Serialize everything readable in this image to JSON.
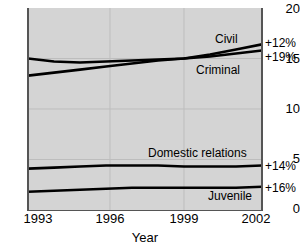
{
  "chart_data": {
    "type": "line",
    "title": "",
    "xlabel": "Year",
    "ylabel": "",
    "xlim": [
      1993,
      2002
    ],
    "ylim": [
      0,
      20
    ],
    "grid": true,
    "legend_position": "inline-right",
    "xticks": [
      "1993",
      "1996",
      "1999",
      "2002"
    ],
    "xtick_values": [
      1993,
      1996,
      1999,
      2002
    ],
    "yticks": [
      "0",
      "5",
      "10",
      "15",
      "20"
    ],
    "ytick_values": [
      0,
      5,
      10,
      15,
      20
    ],
    "x": [
      1993,
      1994,
      1995,
      1996,
      1997,
      1998,
      1999,
      2000,
      2001,
      2002
    ],
    "series": [
      {
        "name": "Civil",
        "label": "Civil",
        "change_label": "+12%",
        "values": [
          15.0,
          14.7,
          14.6,
          14.7,
          14.8,
          14.9,
          15.0,
          15.4,
          15.9,
          16.4
        ],
        "color": "#000000"
      },
      {
        "name": "Criminal",
        "label": "Criminal",
        "change_label": "+19%",
        "values": [
          13.3,
          13.6,
          13.9,
          14.2,
          14.5,
          14.8,
          15.0,
          15.2,
          15.5,
          15.8
        ],
        "color": "#000000"
      },
      {
        "name": "Domestic relations",
        "label": "Domestic relations",
        "change_label": "+14%",
        "values": [
          4.1,
          4.2,
          4.3,
          4.4,
          4.4,
          4.4,
          4.3,
          4.3,
          4.3,
          4.4
        ],
        "color": "#000000"
      },
      {
        "name": "Juvenile",
        "label": "Juvenile",
        "change_label": "+16%",
        "values": [
          1.8,
          1.9,
          2.0,
          2.1,
          2.2,
          2.2,
          2.2,
          2.2,
          2.2,
          2.3
        ],
        "color": "#000000"
      }
    ]
  },
  "axis": {
    "x_title": "Year",
    "y_labels": [
      "20",
      "15",
      "10",
      "5",
      "0"
    ],
    "x_labels": [
      "1993",
      "1996",
      "1999",
      "2002"
    ]
  },
  "annotations": {
    "civil_label": "Civil",
    "criminal_label": "Criminal",
    "domestic_label": "Domestic relations",
    "juvenile_label": "Juvenile",
    "civil_pct": "+12%",
    "criminal_pct": "+19%",
    "domestic_pct": "+14%",
    "juvenile_pct": "+16%"
  },
  "colors": {
    "plot_background": "#d4d4d4",
    "line": "#000000",
    "grid": "#b9b9b9",
    "axis": "#555555",
    "page_background": "#ffffff"
  }
}
